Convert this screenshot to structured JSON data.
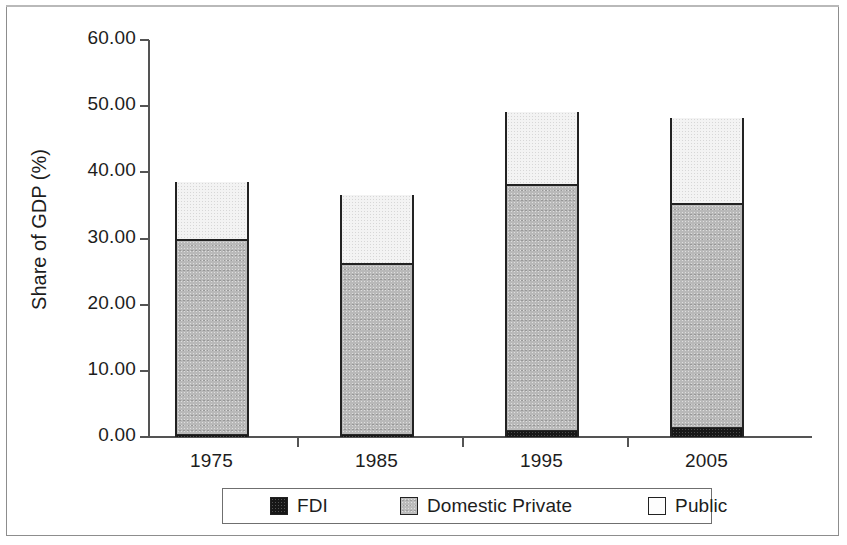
{
  "chart_data": {
    "type": "bar",
    "subtype": "stacked-vertical",
    "title": "",
    "xlabel": "",
    "ylabel": "Share of GDP (%)",
    "ylim": [
      0,
      60
    ],
    "ytick_step": 10,
    "ytick_labels": [
      "0.00",
      "10.00",
      "20.00",
      "30.00",
      "40.00",
      "50.00",
      "60.00"
    ],
    "ytick_values": [
      0,
      10,
      20,
      30,
      40,
      50,
      60
    ],
    "categories": [
      "1975",
      "1985",
      "1995",
      "2005"
    ],
    "grid": false,
    "legend_position": "bottom",
    "series": [
      {
        "name": "FDI",
        "color": "#171717",
        "values": [
          0.3,
          0.3,
          0.9,
          1.4
        ]
      },
      {
        "name": "Domestic Private",
        "color": "#b9b9b9",
        "values": [
          29.7,
          26.0,
          37.3,
          33.9
        ]
      },
      {
        "name": "Public",
        "color": "#f3f3f3",
        "values": [
          8.5,
          10.3,
          10.9,
          12.9
        ]
      }
    ],
    "stack_totals": [
      38.5,
      36.6,
      49.1,
      48.2
    ],
    "segment_boundaries": {
      "fdi_top": [
        0.3,
        0.3,
        0.9,
        1.4
      ],
      "private_top": [
        30.0,
        26.3,
        38.2,
        35.3
      ],
      "public_top": [
        38.5,
        36.6,
        49.1,
        48.2
      ]
    }
  },
  "axes": {
    "y_title": "Share of GDP (%)"
  },
  "legend": {
    "items": [
      {
        "label": "FDI"
      },
      {
        "label": "Domestic Private"
      },
      {
        "label": "Public"
      }
    ]
  }
}
